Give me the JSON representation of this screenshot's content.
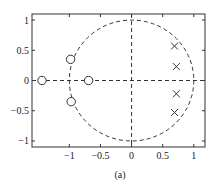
{
  "chart_data": {
    "type": "scatter",
    "title": "",
    "subtitle": "Pole-zero plot",
    "caption": "(a)",
    "xlabel": "",
    "ylabel": "",
    "xlim": [
      -1.6,
      1.18
    ],
    "ylim": [
      -1.1,
      1.1
    ],
    "xticks": [
      -1,
      -0.5,
      0,
      0.5,
      1
    ],
    "xtick_labels": [
      "−1",
      "−0.5",
      "0",
      "0.5",
      "1"
    ],
    "yticks": [
      1,
      0.5,
      0,
      -0.5,
      -1
    ],
    "ytick_labels": [
      "1",
      "0.5",
      "0",
      "−0.5",
      "−1"
    ],
    "grid": false,
    "legend": null,
    "unit_circle": {
      "center": [
        0,
        0
      ],
      "radius": 1,
      "style": "dashed"
    },
    "axis_lines": {
      "x0": "dashed",
      "y0": "dashed"
    },
    "series": [
      {
        "name": "zeros",
        "marker": "o",
        "points": [
          {
            "x": -1.44,
            "y": 0.0
          },
          {
            "x": -0.69,
            "y": 0.0
          },
          {
            "x": -0.98,
            "y": 0.35
          },
          {
            "x": -0.97,
            "y": -0.35
          }
        ]
      },
      {
        "name": "poles",
        "marker": "x",
        "points": [
          {
            "x": 0.69,
            "y": 0.57
          },
          {
            "x": 0.72,
            "y": 0.23
          },
          {
            "x": 0.72,
            "y": -0.22
          },
          {
            "x": 0.69,
            "y": -0.53
          }
        ]
      }
    ]
  }
}
